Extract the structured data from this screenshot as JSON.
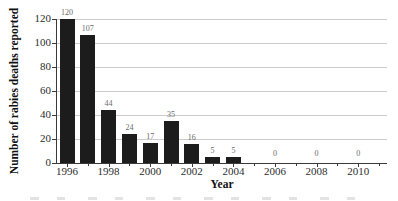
{
  "chart_data": {
    "type": "bar",
    "title": "",
    "xlabel": "Year",
    "ylabel": "Number of rabies deaths reported",
    "categories": [
      1996,
      1997,
      1998,
      1999,
      2000,
      2001,
      2002,
      2003,
      2004,
      2006,
      2008,
      2010
    ],
    "values": [
      120,
      107,
      44,
      24,
      17,
      35,
      16,
      5,
      5,
      0,
      0,
      0
    ],
    "x_ticks": [
      1996,
      1998,
      2000,
      2002,
      2004,
      2006,
      2008,
      2010
    ],
    "minor_x_ticks": [
      1997,
      1999,
      2001,
      2003,
      2005,
      2007,
      2009,
      2011
    ],
    "y_ticks": [
      0,
      20,
      40,
      60,
      80,
      100,
      120
    ],
    "ylim": [
      0,
      120
    ],
    "grid": "horizontal",
    "legend": "none",
    "bar_value_labels_shown": true,
    "colors": {
      "background": "#ffffff",
      "bar": "#1c1c1c",
      "grid": "#cccccc",
      "axis": "#3a3a3a",
      "tick_label": "#2e2e2e",
      "value_label": "#6b6b6b",
      "axis_title": "#111111",
      "caption_remnant": "#dcdcdc"
    }
  }
}
